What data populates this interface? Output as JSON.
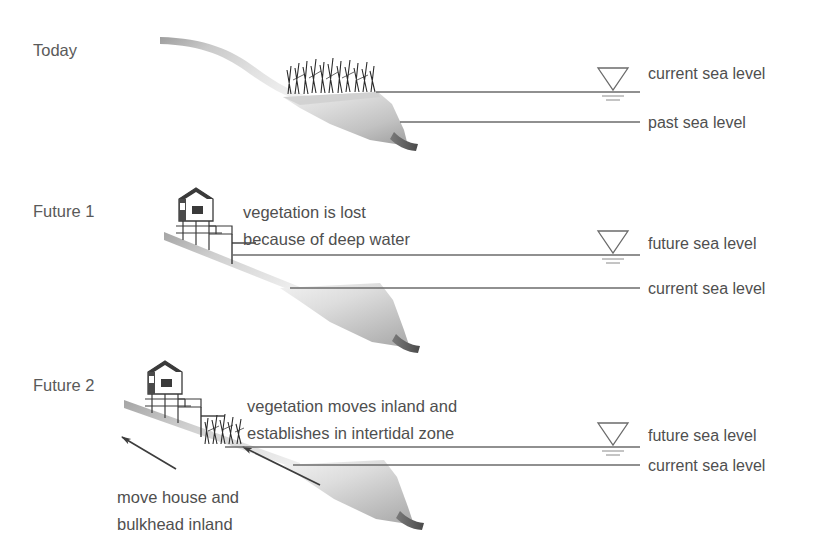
{
  "figure": {
    "background_color": "#ffffff",
    "text_color": "#4f4f4f",
    "line_color": "#6b6b6b",
    "terrain_color_light": "#d8d8d8",
    "terrain_color_dark": "#5c5c5c",
    "vegetation_color": "#2e2e2e",
    "house_color": "#3a3a3a"
  },
  "panels": [
    {
      "id": "today",
      "stage_label": "Today",
      "sea_levels": [
        {
          "name": "current-sea-level",
          "label": "current sea level",
          "marker": "water-triangle"
        },
        {
          "name": "past-sea-level",
          "label": "past sea level",
          "marker": "none"
        }
      ],
      "features": {
        "vegetation": "marsh grass at current sea level",
        "house": "none",
        "annotations": []
      }
    },
    {
      "id": "future-1",
      "stage_label": "Future 1",
      "sea_levels": [
        {
          "name": "future-sea-level",
          "label": "future sea level",
          "marker": "water-triangle"
        },
        {
          "name": "current-sea-level",
          "label": "current sea level",
          "marker": "none"
        }
      ],
      "features": {
        "vegetation": "none",
        "house": "house on pilings with bulkhead",
        "annotations": [
          {
            "name": "vegetation-lost-note",
            "lines": [
              "vegetation is lost",
              "because of deep water"
            ]
          }
        ]
      }
    },
    {
      "id": "future-2",
      "stage_label": "Future 2",
      "sea_levels": [
        {
          "name": "future-sea-level",
          "label": "future sea level",
          "marker": "water-triangle"
        },
        {
          "name": "current-sea-level",
          "label": "current sea level",
          "marker": "none"
        }
      ],
      "features": {
        "vegetation": "marsh grass relocated inland at future sea level",
        "house": "house on pilings with bulkhead moved inland",
        "annotations": [
          {
            "name": "vegetation-moves-note",
            "lines": [
              "vegetation moves inland and",
              "establishes in intertidal zone"
            ]
          },
          {
            "name": "move-house-note",
            "lines": [
              "move house and",
              "bulkhead inland"
            ]
          }
        ],
        "arrows": [
          {
            "name": "retreat-arrow-upper",
            "direction": "up-left"
          },
          {
            "name": "retreat-arrow-lower",
            "direction": "up-left"
          }
        ]
      }
    }
  ],
  "text": {
    "today": "Today",
    "future_1": "Future 1",
    "future_2": "Future 2",
    "current_sea_level": "current sea level",
    "past_sea_level": "past sea level",
    "future_sea_level": "future sea level",
    "note1_line1": "vegetation is lost",
    "note1_line2": "because of deep water",
    "note2_line1": "vegetation moves inland and",
    "note2_line2": "establishes in intertidal zone",
    "note3_line1": "move house and",
    "note3_line2": "bulkhead inland"
  }
}
